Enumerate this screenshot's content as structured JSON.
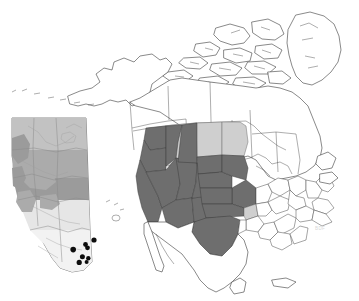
{
  "figure": {
    "kind": "distribution-map",
    "region": "North America",
    "background_color": "#ffffff",
    "watermark_text": "BDF",
    "watermark_position": {
      "x": 315,
      "y": 228
    }
  },
  "legend_classes": [
    {
      "key": "dark",
      "label": "Core range",
      "color": "#6e6e6e"
    },
    {
      "key": "light",
      "label": "Peripheral range",
      "color": "#cfcfcf"
    },
    {
      "key": "none",
      "label": "Absent",
      "color": "#ffffff"
    }
  ],
  "main_map": {
    "name": "north-america-map",
    "outline_color": "#3a3a3a",
    "shaded_dark_states": [
      "Washington",
      "Oregon",
      "California",
      "Idaho",
      "Nevada",
      "Utah",
      "Arizona",
      "New Mexico",
      "Colorado",
      "Wyoming",
      "Nebraska",
      "Kansas",
      "Oklahoma",
      "Texas",
      "South Dakota",
      "Iowa",
      "Missouri"
    ],
    "shaded_light_states": [
      "Montana",
      "North Dakota",
      "Minnesota",
      "Arkansas"
    ],
    "unshaded_regions": [
      "Alaska",
      "Yukon",
      "Northwest Territories",
      "Nunavut",
      "Greenland",
      "British Columbia",
      "Alberta",
      "Saskatchewan",
      "Manitoba",
      "Ontario",
      "Quebec",
      "Newfoundland and Labrador",
      "Mexico",
      "Eastern United States"
    ]
  },
  "inset_map": {
    "name": "alberta-inset",
    "title": "Alberta",
    "base_color": "#d2d2d2",
    "dot_color": "#0d0d0d",
    "dot_count": 8,
    "occurrence_points": [
      {
        "id": 1,
        "x": 94.0,
        "y": 240.0,
        "r": 2.6
      },
      {
        "id": 2,
        "x": 85.5,
        "y": 244.5,
        "r": 2.4
      },
      {
        "id": 3,
        "x": 87.5,
        "y": 247.8,
        "r": 2.4
      },
      {
        "id": 4,
        "x": 73.2,
        "y": 249.6,
        "r": 2.8
      },
      {
        "id": 5,
        "x": 82.4,
        "y": 256.8,
        "r": 2.5
      },
      {
        "id": 6,
        "x": 88.3,
        "y": 258.2,
        "r": 2.2
      },
      {
        "id": 7,
        "x": 79.2,
        "y": 262.4,
        "r": 2.6
      },
      {
        "id": 8,
        "x": 86.6,
        "y": 262.0,
        "r": 2.0
      }
    ]
  }
}
